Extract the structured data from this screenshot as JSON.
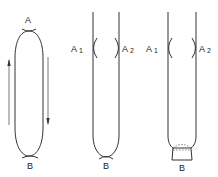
{
  "diagram": {
    "colors": {
      "line": "#333333",
      "background": "#ffffff"
    },
    "figures": [
      {
        "id": "loop",
        "labels": {
          "top": "A",
          "bottom": "B"
        },
        "arrows": [
          {
            "side": "left",
            "direction": "up"
          },
          {
            "side": "right",
            "direction": "down"
          }
        ]
      },
      {
        "id": "open-tube",
        "labels": {
          "left": "A",
          "left_sub": "1",
          "right": "A",
          "right_sub": "2",
          "bottom": "B"
        }
      },
      {
        "id": "tube-with-cap",
        "labels": {
          "left": "A",
          "left_sub": "1",
          "right": "A",
          "right_sub": "2",
          "bottom": "B"
        }
      }
    ]
  }
}
